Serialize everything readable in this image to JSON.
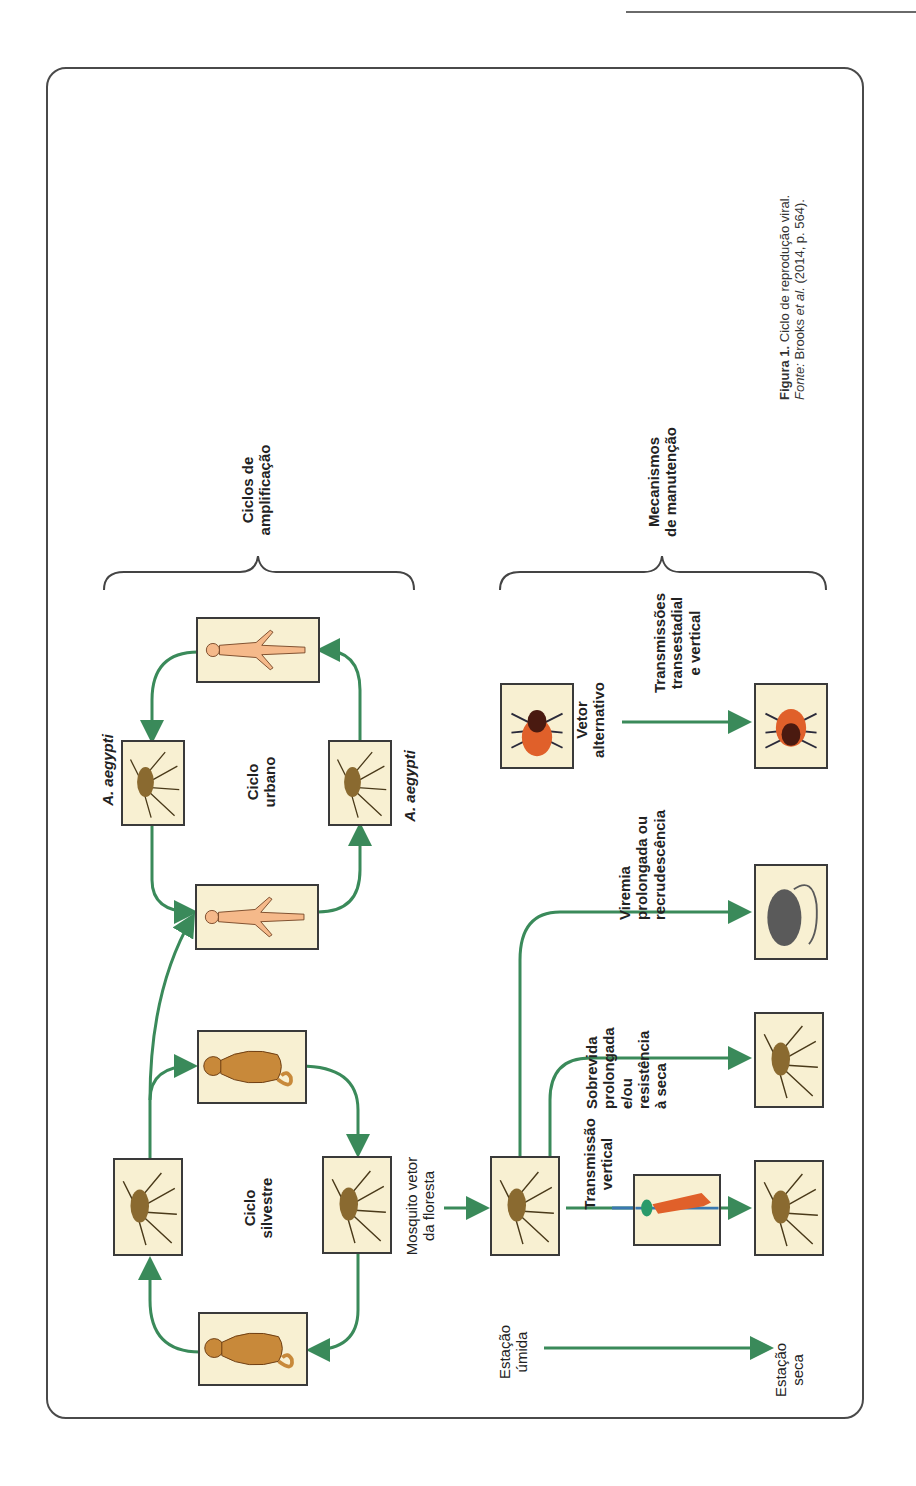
{
  "figure": {
    "caption_label": "Figura 1.",
    "caption_text": "Ciclo de reprodução viral.",
    "source_label": "Fonte:",
    "source_text_a": "Brooks",
    "source_text_italic": "et al.",
    "source_text_b": "(2014, p. 564)."
  },
  "groups": {
    "amplification": "Ciclos de\namplificação",
    "amplification_l1": "Ciclos de",
    "amplification_l2": "amplificação",
    "maintenance_l1": "Mecanismos",
    "maintenance_l2": "de manutenção"
  },
  "cycles": {
    "urban_l1": "Ciclo",
    "urban_l2": "urbano",
    "sylvatic_l1": "Ciclo",
    "sylvatic_l2": "silvestre"
  },
  "labels": {
    "aegypti_top": "A. aegypti",
    "aegypti_bottom": "A. aegypti",
    "forest_mosquito_l1": "Mosquito vetor",
    "forest_mosquito_l2": "da floresta",
    "wet_season_l1": "Estação",
    "wet_season_l2": "úmida",
    "dry_season_l1": "Estação",
    "dry_season_l2": "seca",
    "vertical_l1": "Transmissão",
    "vertical_l2": "vertical",
    "survival_l1": "Sobrevida",
    "survival_l2": "prolongada",
    "survival_l3": "e/ou",
    "survival_l4": "resistência",
    "survival_l5": "à seca",
    "viremia_l1": "Viremia",
    "viremia_l2": "prolongada ou",
    "viremia_l3": "recrudescência",
    "alt_vector_l1": "Vetor",
    "alt_vector_l2": "alternativo",
    "transstadial_l1": "Transmissões",
    "transstadial_l2": "transestadial",
    "transstadial_l3": "e vertical"
  },
  "colors": {
    "arrow": "#3a8a5a",
    "box_fill": "#f8f0d2",
    "box_border": "#3a3a3a",
    "human": "#f5b98a",
    "monkey": "#c8893a",
    "tick_body": "#e0602a",
    "rat": "#5a5a5a"
  },
  "nodes": [
    {
      "id": "human-top",
      "icon": "human-icon"
    },
    {
      "id": "aegypti-top",
      "icon": "mosquito-icon"
    },
    {
      "id": "aegypti-bottom",
      "icon": "mosquito-icon"
    },
    {
      "id": "human-bottom",
      "icon": "human-icon"
    },
    {
      "id": "monkey-top",
      "icon": "monkey-icon"
    },
    {
      "id": "mosquito-sylvatic-top",
      "icon": "mosquito-icon"
    },
    {
      "id": "mosquito-sylvatic-bottom",
      "icon": "mosquito-icon"
    },
    {
      "id": "monkey-bottom",
      "icon": "monkey-icon"
    },
    {
      "id": "forest-mosquito",
      "icon": "mosquito-icon"
    },
    {
      "id": "larva",
      "icon": "larva-icon"
    },
    {
      "id": "mosquito-dry-vertical",
      "icon": "mosquito-icon"
    },
    {
      "id": "mosquito-dry-survival",
      "icon": "mosquito-icon"
    },
    {
      "id": "rat",
      "icon": "rat-icon"
    },
    {
      "id": "tick-top",
      "icon": "tick-icon"
    },
    {
      "id": "tick-bottom",
      "icon": "tick-icon"
    }
  ]
}
